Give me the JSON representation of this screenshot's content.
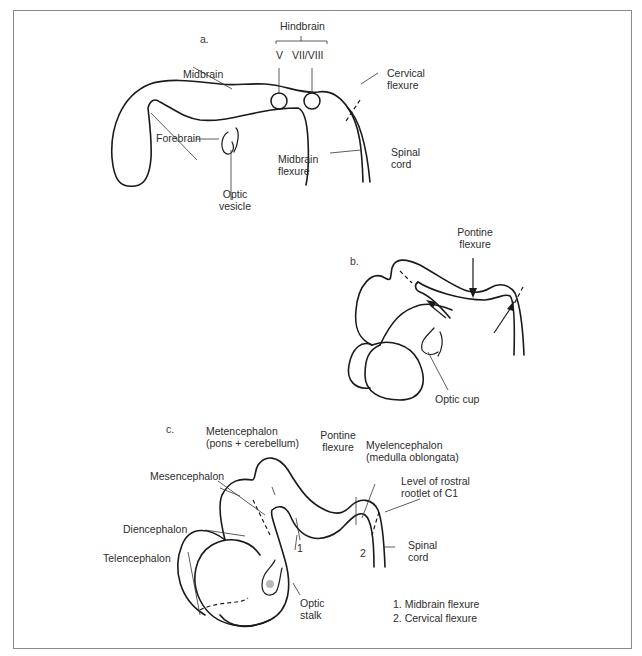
{
  "figure": {
    "panels": [
      {
        "id": "a",
        "label": "a.",
        "labels": {
          "hindbrain": "Hindbrain",
          "nerve_v": "V",
          "nerve_vii_viii": "VII/VIII",
          "midbrain": "Midbrain",
          "forebrain": "Forebrain",
          "optic_vesicle_1": "Optic",
          "optic_vesicle_2": "vesicle",
          "midbrain_flexure_1": "Midbrain",
          "midbrain_flexure_2": "flexure",
          "cervical_flexure_1": "Cervical",
          "cervical_flexure_2": "flexure",
          "spinal_cord_1": "Spinal",
          "spinal_cord_2": "cord"
        }
      },
      {
        "id": "b",
        "label": "b.",
        "labels": {
          "pontine_flexure_1": "Pontine",
          "pontine_flexure_2": "flexure",
          "optic_cup": "Optic cup"
        }
      },
      {
        "id": "c",
        "label": "c.",
        "labels": {
          "metencephalon_1": "Metencephalon",
          "metencephalon_2": "(pons + cerebellum)",
          "pontine_flexure_1": "Pontine",
          "pontine_flexure_2": "flexure",
          "myelencephalon_1": "Myelencephalon",
          "myelencephalon_2": "(medulla oblongata)",
          "level_c1_1": "Level of rostral",
          "level_c1_2": "rootlet of C1",
          "mesencephalon": "Mesencephalon",
          "diencephalon": "Diencephalon",
          "telencephalon": "Telencephalon",
          "optic_stalk_1": "Optic",
          "optic_stalk_2": "stalk",
          "spinal_cord_1": "Spinal",
          "spinal_cord_2": "cord",
          "marker_1": "1",
          "marker_2": "2"
        },
        "legend": [
          "1. Midbrain flexure",
          "2. Cervical flexure"
        ]
      }
    ]
  }
}
